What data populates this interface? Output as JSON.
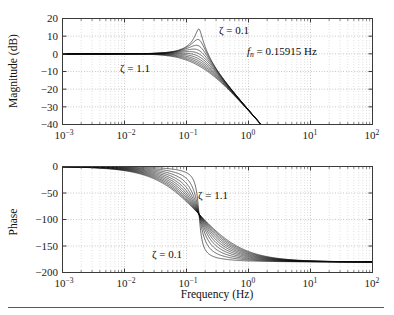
{
  "figure": {
    "title": "",
    "background_color": "#ffffff",
    "curve_color": "#0d0d0d",
    "grid_color": "#b9b9b9",
    "axis_color": "#3a3a3a",
    "bottom_rule": true
  },
  "xaxis": {
    "label": "Frequency (Hz)",
    "scale": "log",
    "min": 0.001,
    "max": 100,
    "tick_mantissa": "10",
    "ticks": [
      {
        "value": 0.001,
        "exp": "−3"
      },
      {
        "value": 0.01,
        "exp": "−2"
      },
      {
        "value": 0.1,
        "exp": "−1"
      },
      {
        "value": 1,
        "exp": "0"
      },
      {
        "value": 10,
        "exp": "1"
      },
      {
        "value": 100,
        "exp": "2"
      }
    ]
  },
  "magnitude_panel": {
    "ylabel": "Magnitude (dB)",
    "yticks": [
      "20",
      "10",
      "0",
      "−10",
      "−20",
      "−30",
      "−40"
    ],
    "ymin": -40,
    "ymax": 20,
    "annotations": [
      {
        "name": "zeta-low-label",
        "text": "ζ = 0.1"
      },
      {
        "name": "zeta-high-label",
        "text": "ζ = 1.1"
      },
      {
        "name": "fn-label",
        "text_italic": "f",
        "text_sub": "n",
        "text_rest": " = 0.15915 Hz"
      }
    ]
  },
  "phase_panel": {
    "ylabel": "Phase",
    "yticks": [
      "0",
      "−50",
      "−100",
      "−150",
      "−200"
    ],
    "ymin": -200,
    "ymax": 0,
    "annotations": [
      {
        "name": "zeta-high-label",
        "text": "ζ = 1.1"
      },
      {
        "name": "zeta-low-label",
        "text": "ζ = 0.1"
      }
    ]
  },
  "chart_data": {
    "type": "line",
    "xlabel": "Frequency (Hz)",
    "ylabel": "Magnitude (dB) / Phase",
    "xscale": "log",
    "xlim": [
      0.001,
      100
    ],
    "grid": true,
    "legend": "none",
    "natural_frequency_hz": 0.15915,
    "damping_ratios": [
      0.1,
      0.2,
      0.3,
      0.4,
      0.5,
      0.6,
      0.7,
      0.8,
      0.9,
      1.0,
      1.1
    ],
    "subplots": [
      {
        "name": "magnitude",
        "ylabel": "Magnitude (dB)",
        "ylim": [
          -40,
          20
        ],
        "yticks": [
          20,
          10,
          0,
          -10,
          -20,
          -30,
          -40
        ],
        "annotations": [
          "ζ = 0.1",
          "ζ = 1.1",
          "f_n = 0.15915 Hz"
        ],
        "peak_db_at_zeta_0p1": 13.98,
        "peak_frequency_hz": 0.158,
        "series": [
          {
            "name": "zeta=0.1",
            "peak_db": 13.98
          },
          {
            "name": "zeta=0.2",
            "peak_db": 8.14
          },
          {
            "name": "zeta=0.3",
            "peak_db": 4.85
          },
          {
            "name": "zeta=0.4",
            "peak_db": 2.7
          },
          {
            "name": "zeta=0.5",
            "peak_db": 1.25
          },
          {
            "name": "zeta=0.6",
            "peak_db": 0.35
          },
          {
            "name": "zeta=0.7",
            "peak_db": 0.0
          },
          {
            "name": "zeta=0.8",
            "peak_db": 0.0
          },
          {
            "name": "zeta=0.9",
            "peak_db": 0.0
          },
          {
            "name": "zeta=1.0",
            "peak_db": 0.0
          },
          {
            "name": "zeta=1.1",
            "peak_db": 0.0
          }
        ],
        "low_frequency_asymptote_db": 0,
        "high_frequency_slope_db_per_decade": -40
      },
      {
        "name": "phase",
        "ylabel": "Phase",
        "ylim": [
          -200,
          0
        ],
        "yticks": [
          0,
          -50,
          -100,
          -150,
          -200
        ],
        "annotations": [
          "ζ = 1.1",
          "ζ = 0.1"
        ],
        "low_frequency_asymptote_deg": 0,
        "phase_at_natural_frequency_deg": -90,
        "high_frequency_asymptote_deg": -180
      }
    ]
  }
}
